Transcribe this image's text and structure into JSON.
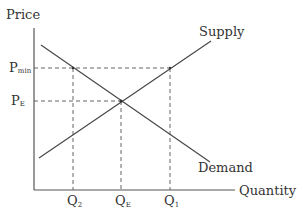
{
  "diagram": {
    "y_axis_label": "Price",
    "x_axis_label": "Quantity",
    "curves": {
      "supply": "Supply",
      "demand": "Demand"
    },
    "price_labels": {
      "pmin_main": "P",
      "pmin_sub": "min",
      "pe_main": "P",
      "pe_sub": "E"
    },
    "quantity_labels": {
      "q2_main": "Q",
      "q2_sub": "2",
      "qe_main": "Q",
      "qe_sub": "E",
      "q1_main": "Q",
      "q1_sub": "1"
    },
    "colors": {
      "line": "#444444",
      "text": "#333333",
      "background": "#ffffff"
    }
  }
}
